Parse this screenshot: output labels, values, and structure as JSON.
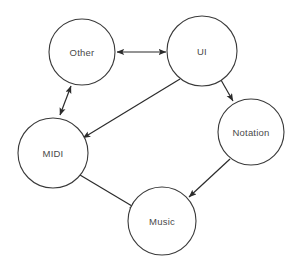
{
  "diagram": {
    "background_color": "#ffffff",
    "node_stroke_color": "#3a3a3a",
    "edge_color": "#2b2b2b",
    "label_color": "#4a4a4a",
    "nodes": [
      {
        "id": "other",
        "label": "Other",
        "cx": 82,
        "cy": 52,
        "r": 33
      },
      {
        "id": "ui",
        "label": "UI",
        "cx": 202,
        "cy": 51,
        "r": 35
      },
      {
        "id": "midi",
        "label": "MIDI",
        "cx": 53,
        "cy": 153,
        "r": 35
      },
      {
        "id": "notation",
        "label": "Notation",
        "cx": 251,
        "cy": 132,
        "r": 33
      },
      {
        "id": "music",
        "label": "Music",
        "cx": 162,
        "cy": 221,
        "r": 34
      }
    ],
    "edges": [
      {
        "id": "other-ui",
        "from": "other",
        "to": "ui",
        "direction": "bidirectional"
      },
      {
        "id": "other-midi",
        "from": "other",
        "to": "midi",
        "direction": "bidirectional"
      },
      {
        "id": "ui-midi",
        "from": "ui",
        "to": "midi",
        "direction": "forward"
      },
      {
        "id": "ui-notation",
        "from": "ui",
        "to": "notation",
        "direction": "forward"
      },
      {
        "id": "midi-music",
        "from": "midi",
        "to": "music",
        "direction": "forward"
      },
      {
        "id": "notation-music",
        "from": "notation",
        "to": "music",
        "direction": "forward"
      }
    ]
  }
}
